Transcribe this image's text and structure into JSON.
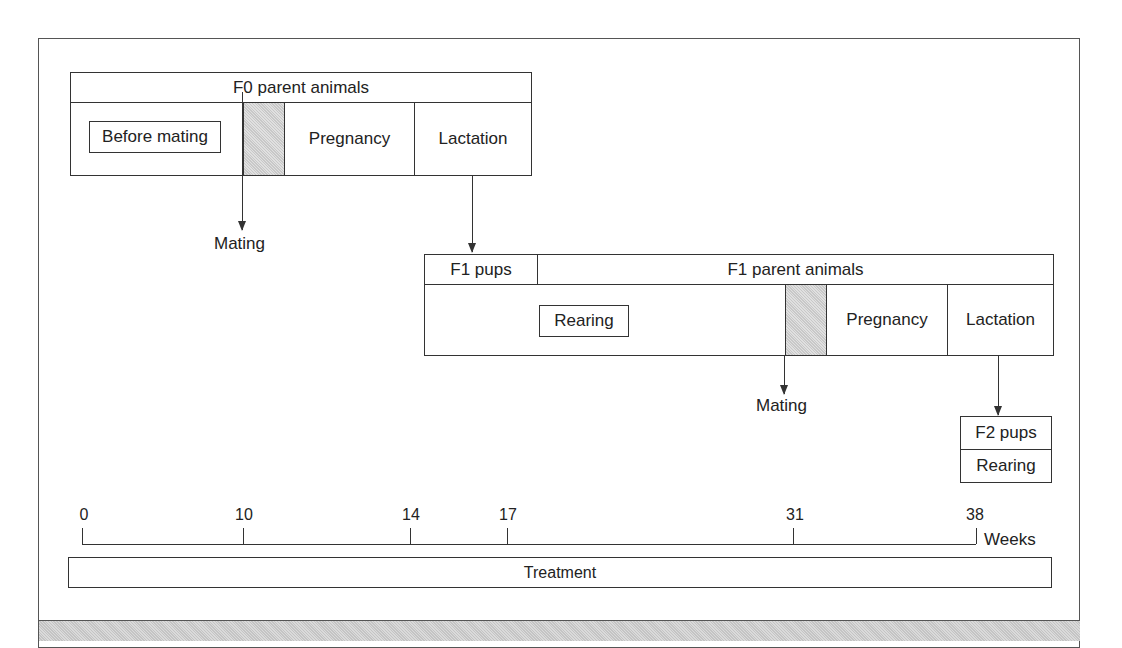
{
  "f0": {
    "header": "F0 parent animals",
    "before_mating": "Before mating",
    "pregnancy": "Pregnancy",
    "lactation": "Lactation",
    "mating_label": "Mating"
  },
  "f1": {
    "pups_header": "F1 pups",
    "parent_header": "F1 parent animals",
    "rearing": "Rearing",
    "pregnancy": "Pregnancy",
    "lactation": "Lactation",
    "mating_label": "Mating"
  },
  "f2": {
    "pups": "F2 pups",
    "rearing": "Rearing"
  },
  "timeline": {
    "ticks": [
      "0",
      "10",
      "14",
      "17",
      "31",
      "38"
    ],
    "unit": "Weeks"
  },
  "treatment": "Treatment"
}
